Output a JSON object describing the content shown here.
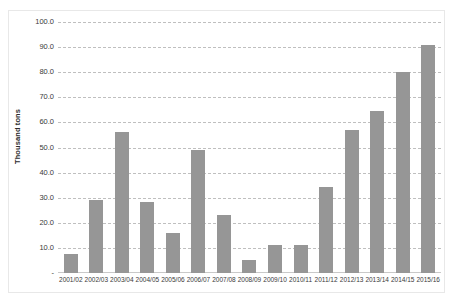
{
  "chart_data": {
    "type": "bar",
    "title": "",
    "xlabel": "",
    "ylabel": "Thousand tons",
    "ylim": [
      0,
      100
    ],
    "ytick_labels": [
      "100.0",
      "90.0",
      "80.0",
      "70.0",
      "60.0",
      "50.0",
      "40.0",
      "30.0",
      "20.0",
      "10.0",
      "-"
    ],
    "ytick_values": [
      100,
      90,
      80,
      70,
      60,
      50,
      40,
      30,
      20,
      10,
      0
    ],
    "grid": true,
    "legend": "none",
    "bar_color": "#969696",
    "gridline_color": "#bfbfbf",
    "categories": [
      "2001/02",
      "2002/03",
      "2003/04",
      "2004/05",
      "2005/06",
      "2006/07",
      "2007/08",
      "2008/09",
      "2009/10",
      "2010/11",
      "2011/12",
      "2012/13",
      "2013/14",
      "2014/15",
      "2015/16"
    ],
    "values": [
      7.7,
      29.0,
      56.3,
      28.3,
      16.0,
      49.2,
      23.0,
      5.0,
      11.0,
      11.1,
      34.2,
      57.0,
      64.7,
      80.2,
      91.0
    ]
  }
}
